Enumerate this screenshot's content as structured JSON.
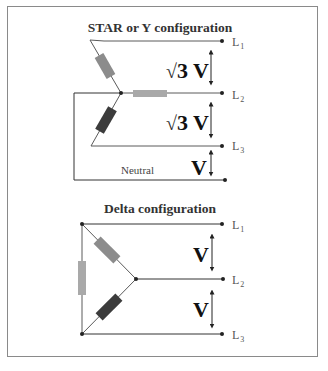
{
  "figure": {
    "frame": {
      "x": 7,
      "y": 6,
      "width": 311,
      "height": 351,
      "border_color": "#8a8a8a"
    },
    "colors": {
      "wire": "#555555",
      "resistor_light": "#a9a9a9",
      "resistor_mid": "#8c8c8c",
      "resistor_dark": "#3c3c3c",
      "text": "#111111"
    }
  },
  "star": {
    "title": "STAR or Y configuration",
    "lines": [
      {
        "label": "L",
        "sub": "1"
      },
      {
        "label": "L",
        "sub": "2"
      },
      {
        "label": "L",
        "sub": "3"
      }
    ],
    "neutral_label": "Neutral",
    "voltages": [
      {
        "prefix": "√",
        "value": "3 V",
        "between": "L1-L2"
      },
      {
        "prefix": "√",
        "value": "3 V",
        "between": "L2-L3"
      },
      {
        "prefix": "",
        "value": "V",
        "between": "L3-Neutral"
      }
    ]
  },
  "delta": {
    "title": "Delta configuration",
    "lines": [
      {
        "label": "L",
        "sub": "1"
      },
      {
        "label": "L",
        "sub": "2"
      },
      {
        "label": "L",
        "sub": "3"
      }
    ],
    "voltages": [
      {
        "value": "V",
        "between": "L1-L2"
      },
      {
        "value": "V",
        "between": "L2-L3"
      }
    ]
  }
}
